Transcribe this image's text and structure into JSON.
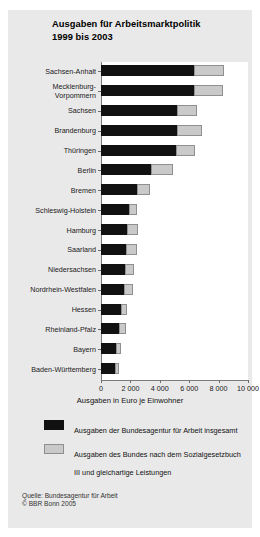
{
  "figure": {
    "panel_bg": "#e9e9e9",
    "title_lines": [
      "Ausgaben für Arbeitsmarktpolitik",
      "1999 bis 2003"
    ]
  },
  "axis": {
    "x_title": "Ausgaben in Euro je Einwohner",
    "x_ticks": [
      "0",
      "2 000",
      "4 000",
      "6 000",
      "8 000",
      "10 000"
    ],
    "x_tick_values": [
      0,
      2000,
      4000,
      6000,
      8000,
      10000
    ],
    "xlim": [
      0,
      10000
    ]
  },
  "legend": {
    "items": [
      {
        "color": "#111111",
        "swatch": "dark",
        "label": "Ausgaben der Bundesagentur für Arbeit insgesamt"
      },
      {
        "color": "#c9c9c9",
        "swatch": "light",
        "label": "Ausgaben des Bundes nach dem Sozialgesetzbuch III und gleichartige Leistungen"
      }
    ]
  },
  "footer": {
    "source": "Quelle: Bundesagentur für Arbeit",
    "copyright": "© BBR Bonn 2005"
  },
  "chart_data": {
    "type": "bar",
    "orientation": "horizontal",
    "stacked": true,
    "title": "Ausgaben für Arbeitsmarktpolitik 1999 bis 2003",
    "xlabel": "Ausgaben in Euro je Einwohner",
    "ylabel": "",
    "xlim": [
      0,
      10000
    ],
    "grid": false,
    "legend_position": "bottom",
    "categories": [
      "Sachsen-Anhalt",
      "Mecklenburg-Vorpommern",
      "Sachsen",
      "Brandenburg",
      "Thüringen",
      "Berlin",
      "Bremen",
      "Schleswig-Holstein",
      "Hamburg",
      "Saarland",
      "Niedersachsen",
      "Nordrhein-Westfalen",
      "Hessen",
      "Rheinland-Pfalz",
      "Bayern",
      "Baden-Württemberg"
    ],
    "series": [
      {
        "name": "Ausgaben der Bundesagentur für Arbeit insgesamt",
        "color": "#111111",
        "values": [
          6350,
          6300,
          5150,
          5150,
          5100,
          3400,
          2450,
          1900,
          1750,
          1700,
          1650,
          1550,
          1350,
          1200,
          1050,
          950
        ]
      },
      {
        "name": "Ausgaben des Bundes nach dem Sozialgesetzbuch III und gleichartige Leistungen",
        "color": "#c9c9c9",
        "values": [
          2050,
          2000,
          1400,
          1750,
          1300,
          1500,
          900,
          550,
          750,
          750,
          600,
          600,
          400,
          500,
          300,
          250
        ]
      }
    ],
    "totals": [
      8400,
      8300,
      6550,
      6900,
      6400,
      4900,
      3350,
      2450,
      2500,
      2450,
      2250,
      2150,
      1750,
      1700,
      1350,
      1200
    ]
  }
}
